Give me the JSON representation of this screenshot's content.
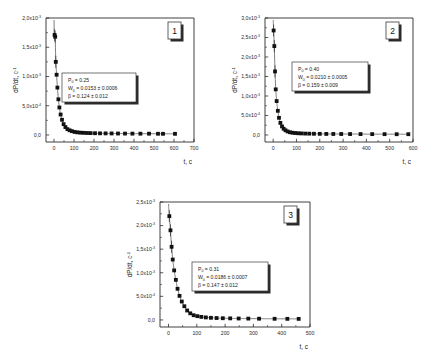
{
  "figure": {
    "panel_count": 3,
    "marker_color": "#111111",
    "curve_color": "#6f6f6f",
    "axis_color": "#2b2b2b"
  },
  "chart_data": [
    {
      "type": "scatter",
      "panel_label": "1",
      "title": "",
      "xlabel": "t, c",
      "ylabel": "dP/dt, c",
      "ylabel_sup": "-1",
      "xlim": [
        -40,
        700
      ],
      "ylim": [
        -0.00012,
        0.002
      ],
      "grid": false,
      "legend": "none",
      "xticks": [
        0,
        100,
        200,
        300,
        400,
        500,
        600,
        700
      ],
      "xticklabels": [
        "0",
        "100",
        "200",
        "300",
        "400",
        "500",
        "600",
        "700"
      ],
      "yticks": [
        0.0,
        0.0005,
        0.001,
        0.0015,
        0.002
      ],
      "yticklabels": [
        "0,0",
        "5,0x10",
        "1,0x10",
        "1,5x10",
        "2,0x10"
      ],
      "yticklabel_sups": [
        "",
        "-4",
        "-3",
        "-3",
        "-3"
      ],
      "annotation": {
        "p_label": "P",
        "p_sub": "0",
        "p_value": "= 0.25",
        "w_label": "W",
        "w_sub": "0",
        "w_value": "= 0.0153 ± 0.0006",
        "beta_label": "β",
        "beta_value": "= 0.124 ± 0.012"
      },
      "x": [
        3,
        6,
        9,
        13,
        17,
        22,
        27,
        33,
        40,
        48,
        57,
        67,
        78,
        90,
        103,
        117,
        132,
        148,
        165,
        183,
        205,
        230,
        258,
        288,
        320,
        355,
        392,
        432,
        475,
        520,
        545,
        605
      ],
      "y": [
        0.00171,
        0.00168,
        0.00125,
        0.00103,
        0.00081,
        0.00061,
        0.00047,
        0.00035,
        0.00026,
        0.000185,
        0.000135,
        0.0001,
        8e-05,
        6.5e-05,
        5.2e-05,
        4.5e-05,
        4e-05,
        3.7e-05,
        3.4e-05,
        3.2e-05,
        3e-05,
        2.8e-05,
        2.7e-05,
        2.6e-05,
        2.5e-05,
        2.4e-05,
        2.3e-05,
        2.2e-05,
        2.2e-05,
        2.1e-05,
        2e-05,
        2e-05
      ]
    },
    {
      "type": "scatter",
      "panel_label": "2",
      "title": "",
      "xlabel": "t, c",
      "ylabel": "dP/dt, c",
      "ylabel_sup": "-1",
      "xlim": [
        -35,
        600
      ],
      "ylim": [
        -0.00018,
        0.003
      ],
      "grid": false,
      "legend": "none",
      "xticks": [
        0,
        100,
        200,
        300,
        400,
        500,
        600
      ],
      "xticklabels": [
        "0",
        "100",
        "200",
        "300",
        "400",
        "500",
        "600"
      ],
      "yticks": [
        0.0,
        0.0005,
        0.001,
        0.0015,
        0.002,
        0.0025,
        0.003
      ],
      "yticklabels": [
        "0,0",
        "5,0x10",
        "1,0x10",
        "1,5x10",
        "2,0x10",
        "2,5x10",
        "3,0x10"
      ],
      "yticklabel_sups": [
        "",
        "-4",
        "-3",
        "-3",
        "-3",
        "-3",
        "-3"
      ],
      "annotation": {
        "p_label": "P",
        "p_sub": "0",
        "p_value": "= 0.40",
        "w_label": "W",
        "w_sub": "0",
        "w_value": "= 0.0210 ± 0.0005",
        "beta_label": "β",
        "beta_value": "= 0.159 ± 0.009"
      },
      "x": [
        2,
        5,
        8,
        11,
        15,
        20,
        25,
        31,
        38,
        45,
        53,
        62,
        72,
        83,
        95,
        108,
        122,
        138,
        155,
        175,
        200,
        228,
        258,
        292,
        330,
        375,
        425,
        478,
        530,
        580
      ],
      "y": [
        0.00268,
        0.00228,
        0.00163,
        0.00117,
        0.00087,
        0.00062,
        0.00044,
        0.00031,
        0.00022,
        0.00016,
        0.00012,
        9e-05,
        7e-05,
        5.8e-05,
        5e-05,
        4.4e-05,
        4e-05,
        3.6e-05,
        3.4e-05,
        3.1e-05,
        2.9e-05,
        2.7e-05,
        2.6e-05,
        2.5e-05,
        2.4e-05,
        2.3e-05,
        2.2e-05,
        2.1e-05,
        2e-05,
        2e-05
      ]
    },
    {
      "type": "scatter",
      "panel_label": "3",
      "title": "",
      "xlabel": "t, c",
      "ylabel": "dP/dt, c",
      "ylabel_sup": "-1",
      "xlim": [
        -30,
        500
      ],
      "ylim": [
        -0.00015,
        0.0025
      ],
      "grid": false,
      "legend": "none",
      "xticks": [
        0,
        100,
        200,
        300,
        400,
        500
      ],
      "xticklabels": [
        "0",
        "100",
        "200",
        "300",
        "400",
        "500"
      ],
      "yticks": [
        0.0,
        0.0005,
        0.001,
        0.0015,
        0.002,
        0.0025
      ],
      "yticklabels": [
        "0,0",
        "5,0x10",
        "1,0x10",
        "1,5x10",
        "2,0x10",
        "2,5x10"
      ],
      "yticklabel_sups": [
        "",
        "-4",
        "-3",
        "-3",
        "-3",
        "-3"
      ],
      "annotation": {
        "p_label": "P",
        "p_sub": "0",
        "p_value": "= 0.31",
        "w_label": "W",
        "w_sub": "0",
        "w_value": "= 0.0186 ± 0.0007",
        "beta_label": "β",
        "beta_value": "= 0.147 ± 0.012"
      },
      "x": [
        3,
        7,
        11,
        15,
        20,
        26,
        32,
        39,
        47,
        56,
        66,
        77,
        89,
        102,
        116,
        132,
        150,
        170,
        192,
        218,
        248,
        282,
        320,
        375,
        420,
        460
      ],
      "y": [
        0.0022,
        0.0019,
        0.00155,
        0.00128,
        0.00105,
        0.00085,
        0.00066,
        0.00051,
        0.00039,
        0.00029,
        0.0002,
        0.00014,
        0.0001,
        8e-05,
        6.5e-05,
        5.3e-05,
        4.5e-05,
        4e-05,
        3.6e-05,
        3.3e-05,
        3e-05,
        2.8e-05,
        2.6e-05,
        2.4e-05,
        2.3e-05,
        2.2e-05
      ]
    }
  ]
}
